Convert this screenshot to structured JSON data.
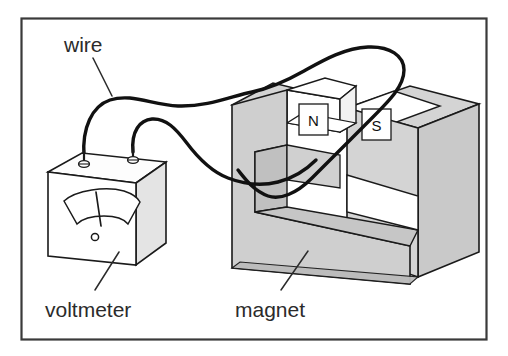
{
  "figure": {
    "kind": "science-diagram",
    "background_color": "#ffffff",
    "frame": {
      "name": "figure-border",
      "color": "#333333",
      "x": 21,
      "y": 18,
      "width": 466,
      "height": 322
    }
  },
  "labels": {
    "wire": "wire",
    "voltmeter": "voltmeter",
    "magnet": "magnet"
  },
  "poles": {
    "north": "N",
    "south": "S"
  },
  "colors": {
    "outline": "#1a1a1a",
    "text": "#2b2b2b",
    "magnet_face_light": "#d2d2d2",
    "magnet_face_mid": "#c4c4c4",
    "magnet_face_dark": "#b9b9b9",
    "meter_face": "#ffffff",
    "meter_side": "#e2e2e2",
    "meter_top": "#fbfbfb",
    "pole_box_fill": "#ffffff",
    "wire_color": "#111111"
  },
  "components": {
    "voltmeter": {
      "name": "voltmeter-body",
      "terminal_count": 2,
      "has_needle_gauge": true,
      "needle_reading": "mid-scale"
    },
    "magnet": {
      "name": "horseshoe-magnet",
      "shape": "U-shaped",
      "pole_left": "N",
      "pole_right": "S"
    },
    "wire": {
      "name": "connecting-wire",
      "loop_through_gap": true,
      "strand_count": 2
    }
  }
}
